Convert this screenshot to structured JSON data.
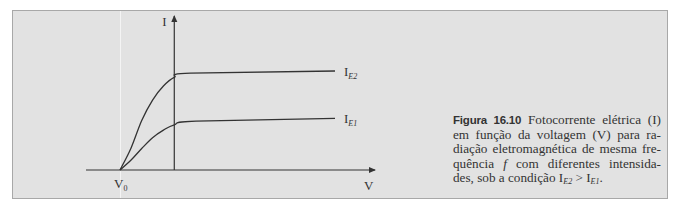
{
  "chart_data": {
    "type": "line",
    "title": "",
    "xlabel": "V",
    "ylabel": "I",
    "origin_label": "V₀",
    "origin_label_main": "V",
    "origin_label_sub": "0",
    "grid": false,
    "legend": "inline-right",
    "x_range": [
      -1.0,
      7.0
    ],
    "y_range": [
      0,
      1.05
    ],
    "x_stopping_potential": -1.0,
    "x_y_axis_position": 0,
    "series": [
      {
        "name": "I_E2",
        "label_main": "I",
        "label_sub": "E2",
        "points": [
          [
            -1.0,
            0.0
          ],
          [
            -0.8,
            0.2
          ],
          [
            -0.6,
            0.46
          ],
          [
            -0.4,
            0.65
          ],
          [
            -0.2,
            0.78
          ],
          [
            0.0,
            0.86
          ],
          [
            0.3,
            0.9
          ],
          [
            7.0,
            0.92
          ]
        ]
      },
      {
        "name": "I_E1",
        "label_main": "I",
        "label_sub": "E1",
        "points": [
          [
            -1.0,
            0.0
          ],
          [
            -0.8,
            0.09
          ],
          [
            -0.6,
            0.2
          ],
          [
            -0.4,
            0.3
          ],
          [
            -0.2,
            0.37
          ],
          [
            0.0,
            0.42
          ],
          [
            0.4,
            0.455
          ],
          [
            7.0,
            0.48
          ]
        ]
      }
    ]
  },
  "caption": {
    "figure_label": "Figura 16.10",
    "lines": [
      {
        "before": " Fotocorrente elétrica (I)"
      },
      {
        "text": "em função da voltagem (V) para ra-"
      },
      {
        "text": "diação eletromagnética de mesma fre-"
      },
      {
        "before": "quência ",
        "italic": "f",
        "after": " com diferentes intensida-"
      },
      {
        "before": "des, sob a condição ",
        "i1_main": "I",
        "i1_sub": "E2",
        "mid": " > ",
        "i2_main": "I",
        "i2_sub": "E1",
        "after": "."
      }
    ]
  },
  "colors": {
    "panel_bg": "#e2e2e2",
    "panel_border": "#a8a8a8",
    "ink": "#333333"
  }
}
